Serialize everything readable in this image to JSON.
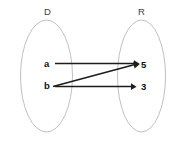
{
  "diagram": {
    "type": "mapping-diagram",
    "background_color": "#ffffff",
    "sets": [
      {
        "id": "domain",
        "label": "D",
        "label_x": 44,
        "label_y": 7,
        "ellipse": {
          "cx": 46.5,
          "cy": 76,
          "rx": 26,
          "ry": 56
        },
        "stroke_color": "#b9b9b9"
      },
      {
        "id": "range",
        "label": "R",
        "label_x": 138,
        "label_y": 7,
        "ellipse": {
          "cx": 141.5,
          "cy": 76,
          "rx": 24,
          "ry": 56
        },
        "stroke_color": "#b9b9b9"
      }
    ],
    "nodes": [
      {
        "id": "a",
        "label": "a",
        "set": "domain",
        "x": 44,
        "y": 59
      },
      {
        "id": "b",
        "label": "b",
        "set": "domain",
        "x": 44,
        "y": 81
      },
      {
        "id": "5",
        "label": "5",
        "set": "range",
        "x": 141,
        "y": 60
      },
      {
        "id": "3",
        "label": "3",
        "set": "range",
        "x": 141,
        "y": 82
      }
    ],
    "edges": [
      {
        "id": "a-to-5",
        "from": "a",
        "to": "5",
        "x1": 55,
        "y1": 63.5,
        "x2": 134,
        "y2": 63.5
      },
      {
        "id": "b-to-5",
        "from": "b",
        "to": "5",
        "x1": 53,
        "y1": 86.5,
        "x2": 134,
        "y2": 64.5
      },
      {
        "id": "b-to-3",
        "from": "b",
        "to": "3",
        "x1": 55,
        "y1": 86.5,
        "x2": 131,
        "y2": 86.5
      }
    ],
    "arrow_color": "#1d1d1d"
  }
}
